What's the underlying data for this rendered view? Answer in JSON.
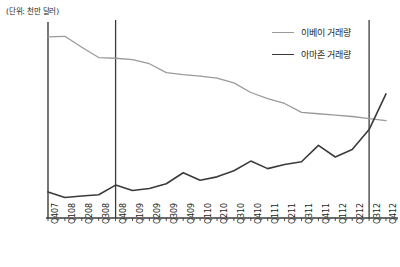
{
  "chart_data": {
    "type": "line",
    "title": "",
    "unit_note": "(단위: 천만 달러)",
    "xlabel": "",
    "ylabel": "",
    "grid": false,
    "legend_position": "top-right",
    "ylim": [
      0,
      14000
    ],
    "yticks": [
      "2,000",
      "4,000",
      "6,000",
      "8,000",
      "10,000",
      "12,000",
      "14,000"
    ],
    "ytick_values": [
      2000,
      4000,
      6000,
      8000,
      10000,
      12000,
      14000
    ],
    "categories": [
      "Q407",
      "Q108",
      "Q208",
      "Q308",
      "Q408",
      "Q109",
      "Q209",
      "Q309",
      "Q409",
      "Q110",
      "Q210",
      "Q310",
      "Q410",
      "Q111",
      "Q211",
      "Q311",
      "Q411",
      "Q112",
      "Q212",
      "Q312",
      "Q412"
    ],
    "series": [
      {
        "name": "이베이 거래량",
        "color": "#9a9a9a",
        "values": [
          13200,
          13250,
          12450,
          11700,
          11650,
          11550,
          11250,
          10600,
          10450,
          10350,
          10200,
          9850,
          9150,
          8700,
          8350,
          7700,
          7600,
          7500,
          7400,
          7250,
          7100
        ]
      },
      {
        "name": "아마존 거래량",
        "color": "#3b3b3b",
        "values": [
          1900,
          1500,
          1600,
          1700,
          2400,
          2000,
          2150,
          2500,
          3300,
          2750,
          3000,
          3450,
          4150,
          3600,
          3900,
          4100,
          5300,
          4450,
          5000,
          6450,
          9050
        ]
      }
    ],
    "markers": [
      {
        "name": "marker-q408",
        "category": "Q408"
      },
      {
        "name": "marker-q312",
        "category": "Q312"
      }
    ]
  },
  "legend": {
    "items": [
      {
        "label": "이베이 거래량",
        "color": "#9a9a9a"
      },
      {
        "label": "아마존 거래량",
        "color": "#3b3b3b"
      }
    ]
  },
  "axis_colors": {
    "axis_line": "#3b3b3b",
    "marker_line": "#3b3b3b",
    "text": "#231f20"
  }
}
